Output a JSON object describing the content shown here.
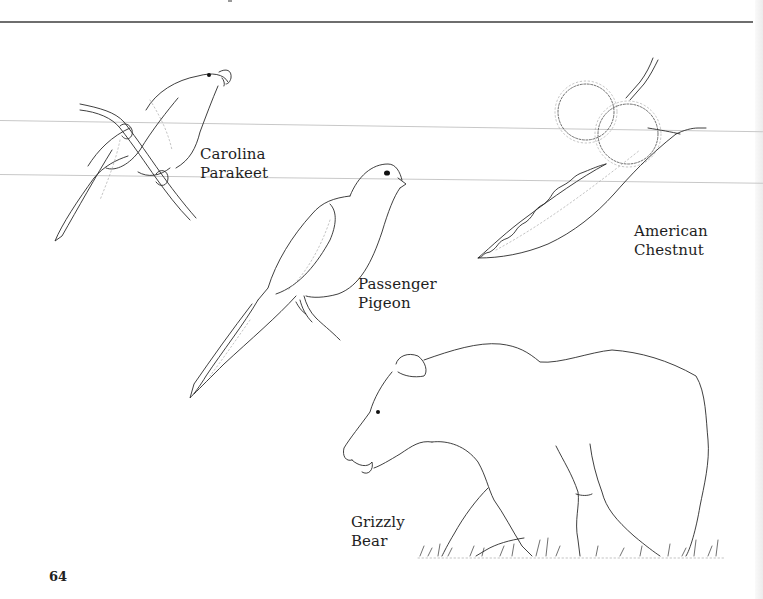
{
  "page": {
    "number": "64",
    "background": "#ffffff",
    "rule_color": "#6e6e6e"
  },
  "illustrations": [
    {
      "id": "carolina-parakeet",
      "label_lines": [
        "Carolina",
        "Parakeet"
      ]
    },
    {
      "id": "passenger-pigeon",
      "label_lines": [
        "Passenger",
        "Pigeon"
      ]
    },
    {
      "id": "american-chestnut",
      "label_lines": [
        "American",
        "Chestnut"
      ]
    },
    {
      "id": "grizzly-bear",
      "label_lines": [
        "Grizzly",
        "Bear"
      ]
    }
  ]
}
